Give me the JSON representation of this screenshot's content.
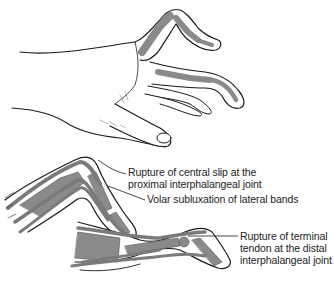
{
  "figure": {
    "panels": [
      {
        "name": "normal-hand",
        "description": "Hand with fingers shown, bones visible in flexed fingers"
      },
      {
        "name": "boutonniere-finger",
        "description": "Finger with rupture of central slip and volar subluxation of lateral bands"
      },
      {
        "name": "mallet-finger",
        "description": "Finger with rupture of terminal tendon at DIP joint"
      }
    ],
    "labels": {
      "central_slip_line1": "Rupture of central slip at the",
      "central_slip_line2": "proximal interphalangeal joint",
      "lateral_bands": "Volar subluxation of lateral bands",
      "terminal_line1": "Rupture of terminal",
      "terminal_line2": "tendon at the distal",
      "terminal_line3": "interphalangeal joint"
    },
    "colors": {
      "background": "#ffffff",
      "outline": "#1a1a1a",
      "bone": "#8a8a8a",
      "tendon": "#7a7a7a",
      "skin": "#ffffff",
      "text": "#222222"
    }
  }
}
